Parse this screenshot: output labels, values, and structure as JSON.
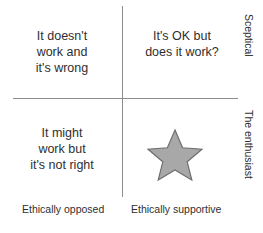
{
  "diagram": {
    "type": "2x2-quadrant-matrix",
    "quadrants": {
      "top_left": {
        "text": "It doesn't\nwork and\nit's wrong"
      },
      "top_right": {
        "text": "It's OK but\ndoes it work?"
      },
      "bottom_left": {
        "text": "It might\nwork but\nit's not right"
      },
      "bottom_right": {
        "text": ""
      }
    },
    "axes": {
      "x_left_label": "Ethically opposed",
      "x_right_label": "Ethically supportive",
      "y_top_label": "Sceptical",
      "y_bottom_label": "The enthusiast",
      "line_color": "#8c8c8c"
    },
    "marker": {
      "name": "star",
      "quadrant": "bottom_right",
      "fill": "#a8a8a8",
      "stroke": "#6e6e6e"
    }
  }
}
